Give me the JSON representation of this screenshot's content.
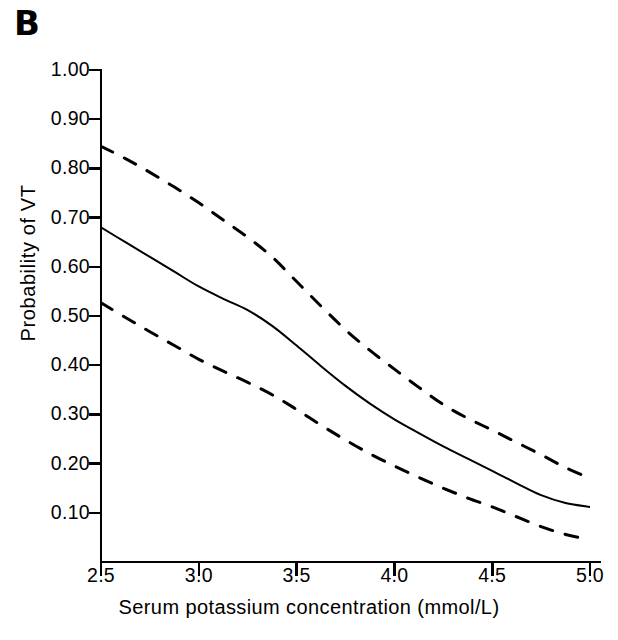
{
  "panel": {
    "label": "B"
  },
  "axis": {
    "y_title": "Probability of VT",
    "x_title": "Serum potassium concentration (mmol/L)",
    "y_ticks": [
      "1.00",
      "0.90",
      "0.80",
      "0.70",
      "0.60",
      "0.50",
      "0.40",
      "0.30",
      "0.20",
      "0.10"
    ],
    "x_ticks": [
      "2.5",
      "3.0",
      "3.5",
      "4.0",
      "4.5",
      "5.0"
    ]
  },
  "style": {
    "line_color": "#000000",
    "axis_color": "#000000",
    "background": "#ffffff",
    "solid_width": 2.0,
    "dashed_width": 3.0,
    "dash_pattern": "13 13"
  },
  "chart_data": {
    "type": "line",
    "title": "B",
    "xlabel": "Serum potassium concentration (mmol/L)",
    "ylabel": "Probability of VT",
    "xlim": [
      2.5,
      5.0
    ],
    "ylim": [
      0.0,
      1.0
    ],
    "xticks": [
      2.5,
      3.0,
      3.5,
      4.0,
      4.5,
      5.0
    ],
    "yticks": [
      0.1,
      0.2,
      0.3,
      0.4,
      0.5,
      0.6,
      0.7,
      0.8,
      0.9,
      1.0
    ],
    "grid": false,
    "legend": "none",
    "x": [
      2.5,
      2.625,
      2.75,
      2.875,
      3.0,
      3.125,
      3.25,
      3.375,
      3.5,
      3.625,
      3.75,
      3.875,
      4.0,
      4.125,
      4.25,
      4.375,
      4.5,
      4.625,
      4.75,
      4.875,
      5.0
    ],
    "series": [
      {
        "name": "Upper 95% confidence limit",
        "linestyle": "dashed",
        "values": [
          0.845,
          0.82,
          0.792,
          0.762,
          0.73,
          0.695,
          0.66,
          0.62,
          0.57,
          0.52,
          0.472,
          0.43,
          0.392,
          0.355,
          0.32,
          0.292,
          0.268,
          0.243,
          0.218,
          0.192,
          0.17
        ]
      },
      {
        "name": "Estimated probability of VT",
        "linestyle": "solid",
        "values": [
          0.68,
          0.65,
          0.62,
          0.59,
          0.56,
          0.535,
          0.512,
          0.48,
          0.44,
          0.398,
          0.358,
          0.322,
          0.29,
          0.262,
          0.235,
          0.21,
          0.185,
          0.16,
          0.136,
          0.12,
          0.112
        ]
      },
      {
        "name": "Lower 95% confidence limit",
        "linestyle": "dashed",
        "values": [
          0.527,
          0.497,
          0.468,
          0.44,
          0.412,
          0.388,
          0.365,
          0.34,
          0.31,
          0.278,
          0.248,
          0.22,
          0.195,
          0.172,
          0.15,
          0.13,
          0.112,
          0.092,
          0.072,
          0.056,
          0.045
        ]
      }
    ]
  }
}
